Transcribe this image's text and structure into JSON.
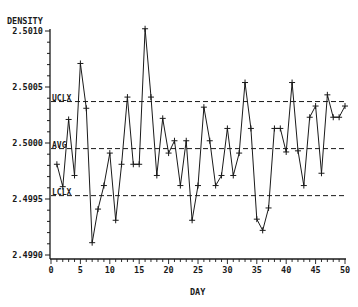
{
  "chart_data": {
    "type": "line",
    "title": "",
    "xlabel": "DAY",
    "ylabel": "DENSITY",
    "xlim": [
      0,
      50
    ],
    "ylim": [
      2.499,
      2.501
    ],
    "x_ticks": [
      0,
      5,
      10,
      15,
      20,
      25,
      30,
      35,
      40,
      45,
      50
    ],
    "y_ticks": [
      "2.4990",
      "2.4995",
      "2.5000",
      "2.5005",
      "2.5010"
    ],
    "grid": false,
    "legend": null,
    "series": [
      {
        "name": "Density",
        "marker": "+",
        "x": [
          1,
          2,
          3,
          4,
          5,
          6,
          7,
          8,
          9,
          10,
          11,
          12,
          13,
          14,
          15,
          16,
          17,
          18,
          19,
          20,
          21,
          22,
          23,
          24,
          25,
          26,
          27,
          28,
          29,
          30,
          31,
          32,
          33,
          34,
          35,
          36,
          37,
          38,
          39,
          40,
          41,
          42,
          43,
          44,
          45,
          46,
          47,
          48,
          49,
          50
        ],
        "values": [
          2.49981,
          2.49961,
          2.50021,
          2.49971,
          2.50071,
          2.50031,
          2.49911,
          2.49941,
          2.49962,
          2.49991,
          2.49931,
          2.49981,
          2.50041,
          2.49981,
          2.49981,
          2.50102,
          2.50041,
          2.49971,
          2.50022,
          2.49991,
          2.50002,
          2.49962,
          2.50002,
          2.49931,
          2.49962,
          2.50032,
          2.50002,
          2.49962,
          2.49971,
          2.50013,
          2.49971,
          2.49991,
          2.50054,
          2.50013,
          2.49932,
          2.49922,
          2.49942,
          2.50013,
          2.50013,
          2.49992,
          2.50054,
          2.49993,
          2.49962,
          2.50023,
          2.50033,
          2.49973,
          2.50043,
          2.50023,
          2.50023,
          2.50033
        ]
      }
    ],
    "reference_lines": [
      {
        "label": "UCLX",
        "value": 2.50037,
        "style": "dashed"
      },
      {
        "label": "AVG",
        "value": 2.49995,
        "style": "dashed"
      },
      {
        "label": "LCLX",
        "value": 2.49953,
        "style": "dashed"
      }
    ]
  },
  "labels": {
    "y_title": "DENSITY",
    "x_title": "DAY",
    "ucl": "UCLX",
    "avg": "AVG",
    "lcl": "LCLX"
  },
  "colors": {
    "ink": "#1a1a1a",
    "background": "#ffffff"
  }
}
